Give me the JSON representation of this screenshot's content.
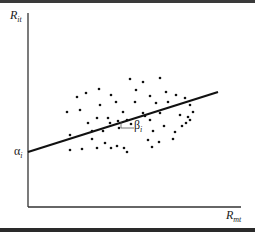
{
  "chart_data": {
    "type": "scatter",
    "title": "",
    "xlabel": "R_mt",
    "ylabel": "R_it",
    "xlabel_main": "R",
    "xlabel_sub": "mt",
    "ylabel_main": "R",
    "ylabel_sub": "it",
    "annotations": {
      "intercept_main": "α",
      "intercept_sub": "i",
      "slope_main": "β",
      "slope_sub": "i"
    },
    "grid": false,
    "legend": null,
    "regression_line": {
      "x0": 28,
      "y0": 152,
      "x1": 218,
      "y1": 92
    },
    "points_px": [
      [
        67,
        112
      ],
      [
        77,
        97
      ],
      [
        86,
        93
      ],
      [
        99,
        89
      ],
      [
        80,
        110
      ],
      [
        100,
        105
      ],
      [
        116,
        102
      ],
      [
        111,
        95
      ],
      [
        88,
        123
      ],
      [
        97,
        118
      ],
      [
        108,
        118
      ],
      [
        110,
        123
      ],
      [
        118,
        121
      ],
      [
        127,
        120
      ],
      [
        119,
        128
      ],
      [
        131,
        124
      ],
      [
        70,
        150
      ],
      [
        82,
        149
      ],
      [
        92,
        139
      ],
      [
        97,
        148
      ],
      [
        105,
        143
      ],
      [
        111,
        148
      ],
      [
        117,
        146
      ],
      [
        124,
        148
      ],
      [
        127,
        152
      ],
      [
        70,
        135
      ],
      [
        92,
        131
      ],
      [
        103,
        131
      ],
      [
        136,
        90
      ],
      [
        143,
        82
      ],
      [
        160,
        78
      ],
      [
        150,
        96
      ],
      [
        166,
        92
      ],
      [
        176,
        95
      ],
      [
        168,
        102
      ],
      [
        156,
        103
      ],
      [
        185,
        98
      ],
      [
        190,
        105
      ],
      [
        193,
        112
      ],
      [
        186,
        123
      ],
      [
        180,
        115
      ],
      [
        190,
        120
      ],
      [
        175,
        132
      ],
      [
        153,
        131
      ],
      [
        150,
        120
      ],
      [
        143,
        113
      ],
      [
        160,
        113
      ],
      [
        135,
        102
      ],
      [
        123,
        112
      ],
      [
        130,
        79
      ],
      [
        145,
        116
      ],
      [
        164,
        126
      ],
      [
        148,
        140
      ],
      [
        159,
        142
      ],
      [
        173,
        139
      ],
      [
        182,
        126
      ],
      [
        188,
        117
      ],
      [
        152,
        147
      ]
    ],
    "x_axis": {
      "x0": 28,
      "x1": 241,
      "y": 207
    },
    "y_axis": {
      "x": 28,
      "y0": 13,
      "y1": 207
    }
  }
}
